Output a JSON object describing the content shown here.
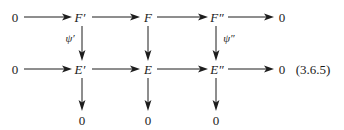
{
  "figure": {
    "kind": "commutative-diagram",
    "equation_number": "(3.6.5)",
    "background_color": "#ffffff",
    "ink_color": "#1d1d1d",
    "rows": [
      {
        "id": "top-row",
        "nodes": [
          "0",
          "F′",
          "F",
          "F″",
          "0"
        ]
      },
      {
        "id": "bottom-row",
        "nodes": [
          "0",
          "E′",
          "E",
          "E″",
          "0"
        ]
      },
      {
        "id": "zero-row",
        "nodes": [
          "0",
          "0",
          "0"
        ]
      }
    ],
    "nodes": {
      "r1c0": "0",
      "r1c1": "F′",
      "r1c2": "F",
      "r1c3": "F″",
      "r1c4": "0",
      "r2c0": "0",
      "r2c1": "E′",
      "r2c2": "E",
      "r2c3": "E″",
      "r2c4": "0",
      "r3c1": "0",
      "r3c2": "0",
      "r3c3": "0"
    },
    "vertical_map_labels": {
      "left": "ψ′",
      "middle": "",
      "right": "ψ″"
    }
  }
}
